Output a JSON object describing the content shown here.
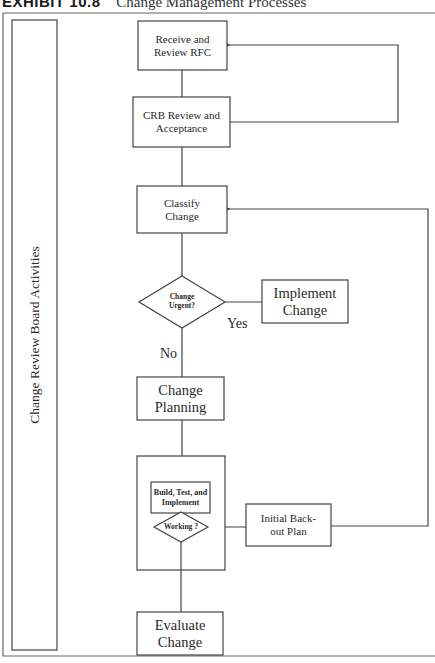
{
  "title": {
    "exhibit_number": "EXHIBIT 10.8",
    "caption": "Change Management Processes"
  },
  "swimlane": {
    "label": "Change Review Board Activities"
  },
  "nodes": {
    "receive_rfc": {
      "type": "process",
      "label": "Receive and Review RFC"
    },
    "crb_review": {
      "type": "process",
      "label": "CRB Review and Acceptance"
    },
    "classify": {
      "type": "process",
      "label": "Classify Change"
    },
    "urgent_decision": {
      "type": "decision",
      "label": "Change Urgent?"
    },
    "implement": {
      "type": "process",
      "label": "Implement Change"
    },
    "planning": {
      "type": "process",
      "label": "Change Planning"
    },
    "build_group": {
      "type": "group",
      "inner_process": {
        "label": "Build, Test, and Implement"
      },
      "decision": {
        "label": "Working ?"
      }
    },
    "backout": {
      "type": "process",
      "label": "Initial Back-out Plan"
    },
    "evaluate": {
      "type": "process",
      "label": "Evaluate Change"
    }
  },
  "edge_labels": {
    "yes": "Yes",
    "no": "No"
  },
  "edges": [
    {
      "from": "receive_rfc",
      "to": "crb_review"
    },
    {
      "from": "crb_review",
      "to": "receive_rfc",
      "arrow": true
    },
    {
      "from": "crb_review",
      "to": "classify"
    },
    {
      "from": "classify",
      "to": "urgent_decision"
    },
    {
      "from": "urgent_decision",
      "to": "implement",
      "label": "Yes"
    },
    {
      "from": "urgent_decision",
      "to": "planning",
      "label": "No"
    },
    {
      "from": "planning",
      "to": "build_group"
    },
    {
      "from": "build_group",
      "to": "backout"
    },
    {
      "from": "backout",
      "to": "classify",
      "arrow": true
    },
    {
      "from": "build_group",
      "to": "evaluate"
    }
  ]
}
